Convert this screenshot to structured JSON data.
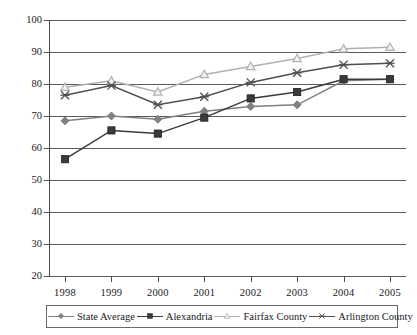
{
  "chart_data": {
    "type": "line",
    "title": "",
    "xlabel": "",
    "ylabel": "",
    "categories": [
      "1998",
      "1999",
      "2000",
      "2001",
      "2002",
      "2003",
      "2004",
      "2005"
    ],
    "ylim": [
      20,
      100
    ],
    "yticks": [
      20,
      30,
      40,
      50,
      60,
      70,
      80,
      90,
      100
    ],
    "grid": true,
    "legend_position": "bottom",
    "series": [
      {
        "name": "State Average",
        "marker": "diamond",
        "color": "#808080",
        "values": [
          68.5,
          70.0,
          69.0,
          71.5,
          73.0,
          73.5,
          81.0,
          81.5
        ]
      },
      {
        "name": "Alexandria",
        "marker": "square",
        "color": "#3a3a3a",
        "values": [
          56.5,
          65.5,
          64.5,
          69.5,
          75.5,
          77.5,
          81.5,
          81.5
        ]
      },
      {
        "name": "Fairfax County",
        "marker": "triangle",
        "color": "#b0b0b0",
        "values": [
          79.0,
          81.0,
          77.5,
          83.0,
          85.5,
          88.0,
          91.0,
          91.5
        ]
      },
      {
        "name": "Arlington County",
        "marker": "x",
        "color": "#4f4f4f",
        "values": [
          76.5,
          79.5,
          73.5,
          76.0,
          80.5,
          83.5,
          86.0,
          86.5
        ]
      }
    ]
  },
  "axis": {
    "y_tick_labels": [
      "100",
      "90",
      "80",
      "70",
      "60",
      "50",
      "40",
      "30",
      "20"
    ],
    "x_tick_labels": [
      "1998",
      "1999",
      "2000",
      "2001",
      "2002",
      "2003",
      "2004",
      "2005"
    ]
  },
  "legend": {
    "items": [
      {
        "label": "State Average"
      },
      {
        "label": "Alexandria"
      },
      {
        "label": "Fairfax County"
      },
      {
        "label": "Arlington County"
      }
    ]
  }
}
